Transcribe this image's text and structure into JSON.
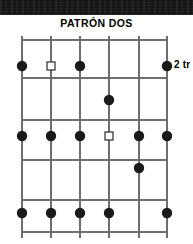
{
  "title": "PATRÓN DOS",
  "fret_position_label": "2 tr",
  "colors": {
    "band": "#151515",
    "grid_line": "#6e6e6e",
    "note_filled": "#1a1a1a",
    "note_open_fill": "#ffffff",
    "note_open_stroke": "#2b2b2b",
    "text": "#000000",
    "background": "#ffffff"
  },
  "diagram": {
    "type": "guitar-fretboard-pattern",
    "string_count": 6,
    "fret_space_count": 5,
    "string_x": [
      22,
      51,
      80,
      109,
      139,
      167
    ],
    "fret_y": [
      40,
      78,
      120,
      160,
      200,
      232
    ],
    "note_row_y": [
      66,
      100,
      136,
      168,
      213
    ],
    "string_top": 36,
    "string_bottom": 238,
    "note_radius": 5.2,
    "open_note_size": 8,
    "notes": [
      {
        "row": 1,
        "string": 1,
        "marker": "filled"
      },
      {
        "row": 1,
        "string": 2,
        "marker": "open"
      },
      {
        "row": 1,
        "string": 3,
        "marker": "filled"
      },
      {
        "row": 1,
        "string": 6,
        "marker": "filled"
      },
      {
        "row": 2,
        "string": 4,
        "marker": "filled"
      },
      {
        "row": 3,
        "string": 1,
        "marker": "filled"
      },
      {
        "row": 3,
        "string": 2,
        "marker": "filled"
      },
      {
        "row": 3,
        "string": 3,
        "marker": "filled"
      },
      {
        "row": 3,
        "string": 4,
        "marker": "open"
      },
      {
        "row": 3,
        "string": 5,
        "marker": "filled"
      },
      {
        "row": 3,
        "string": 6,
        "marker": "filled"
      },
      {
        "row": 4,
        "string": 5,
        "marker": "filled"
      },
      {
        "row": 5,
        "string": 1,
        "marker": "filled"
      },
      {
        "row": 5,
        "string": 2,
        "marker": "filled"
      },
      {
        "row": 5,
        "string": 3,
        "marker": "filled"
      },
      {
        "row": 5,
        "string": 4,
        "marker": "filled"
      },
      {
        "row": 5,
        "string": 6,
        "marker": "filled"
      }
    ]
  }
}
